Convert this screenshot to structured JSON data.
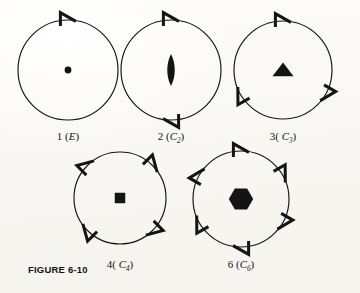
{
  "figure": {
    "caption": "FIGURE 6-10",
    "background_color": "#fdfcfa",
    "ink_color": "#141414"
  },
  "diagrams": [
    {
      "id": "c1",
      "order": 1,
      "label_number": "1",
      "label_group": "(E)",
      "label_text": "1 (E)",
      "center_symbol": "dot",
      "center_symbol_name": "filled-circle",
      "marker_count": 1,
      "marker_angles_deg": [
        0
      ],
      "marker_name": "hook-marker",
      "cx": 68,
      "cy": 70,
      "r": 50
    },
    {
      "id": "c2",
      "order": 2,
      "label_number": "2",
      "label_group": "(C2)",
      "label_text": "2 (C2)",
      "center_symbol": "lens",
      "center_symbol_name": "pointed-oval",
      "marker_count": 2,
      "marker_angles_deg": [
        0,
        180
      ],
      "marker_name": "hook-marker",
      "cx": 171,
      "cy": 70,
      "r": 50
    },
    {
      "id": "c3",
      "order": 3,
      "label_number": "3",
      "label_group": "(C3)",
      "label_text": "3( C3)",
      "center_symbol": "triangle",
      "center_symbol_name": "filled-triangle",
      "marker_count": 3,
      "marker_angles_deg": [
        0,
        120,
        240
      ],
      "marker_name": "hook-marker",
      "cx": 283,
      "cy": 70,
      "r": 49
    },
    {
      "id": "c4",
      "order": 4,
      "label_number": "4",
      "label_group": "(C4)",
      "label_text": "4( C4)",
      "center_symbol": "square",
      "center_symbol_name": "filled-square",
      "marker_count": 4,
      "marker_angles_deg": [
        45,
        135,
        225,
        315
      ],
      "marker_name": "hook-marker",
      "cx": 120,
      "cy": 198,
      "r": 46
    },
    {
      "id": "c6",
      "order": 6,
      "label_number": "6",
      "label_group": "(C6)",
      "label_text": "6 (C6)",
      "center_symbol": "hexagon",
      "center_symbol_name": "filled-hexagon",
      "marker_count": 6,
      "marker_angles_deg": [
        0,
        60,
        120,
        180,
        240,
        300
      ],
      "marker_name": "hook-marker",
      "cx": 241,
      "cy": 199,
      "r": 48
    }
  ],
  "labels": {
    "c1": {
      "num": "1 (",
      "sym": "E",
      "sub": "",
      "close": ")"
    },
    "c2": {
      "num": "2 (",
      "sym": "C",
      "sub": "2",
      "close": ")"
    },
    "c3": {
      "num": "3( ",
      "sym": "C",
      "sub": "3",
      "close": ")"
    },
    "c4": {
      "num": "4( ",
      "sym": "C",
      "sub": "4",
      "close": ")"
    },
    "c6": {
      "num": "6 (",
      "sym": "C",
      "sub": "6",
      "close": ")"
    }
  }
}
